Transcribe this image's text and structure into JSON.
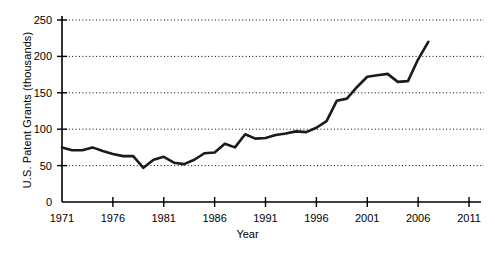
{
  "chart_data": {
    "type": "line",
    "title": "",
    "xlabel": "Year",
    "ylabel": "U.S. Patent Grants (thousands)",
    "xlim": [
      1971,
      2011
    ],
    "ylim": [
      0,
      250
    ],
    "xticks": [
      1971,
      1976,
      1981,
      1986,
      1991,
      1996,
      2001,
      2006,
      2011
    ],
    "yticks": [
      0,
      50,
      100,
      150,
      200,
      250
    ],
    "grid": "horizontal-dotted",
    "legend": "none",
    "line_color": "#1a1a1a",
    "x": [
      1971,
      1972,
      1973,
      1974,
      1975,
      1976,
      1977,
      1978,
      1979,
      1980,
      1981,
      1982,
      1983,
      1984,
      1985,
      1986,
      1987,
      1988,
      1989,
      1990,
      1991,
      1992,
      1993,
      1994,
      1995,
      1996,
      1997,
      1998,
      1999,
      2000,
      2001,
      2002,
      2003,
      2004,
      2005,
      2006,
      2007
    ],
    "values": [
      75,
      71,
      71,
      75,
      70,
      66,
      63,
      63,
      47,
      58,
      62,
      54,
      52,
      58,
      67,
      68,
      80,
      75,
      93,
      87,
      88,
      92,
      94,
      97,
      96,
      102,
      111,
      139,
      142,
      158,
      172,
      174,
      176,
      165,
      166,
      196,
      220
    ],
    "series": [
      {
        "name": "U.S. Patent Grants",
        "values": [
          75,
          71,
          71,
          75,
          70,
          66,
          63,
          63,
          47,
          58,
          62,
          54,
          52,
          58,
          67,
          68,
          80,
          75,
          93,
          87,
          88,
          92,
          94,
          97,
          96,
          102,
          111,
          139,
          142,
          158,
          172,
          174,
          176,
          165,
          166,
          196,
          220
        ]
      }
    ]
  }
}
